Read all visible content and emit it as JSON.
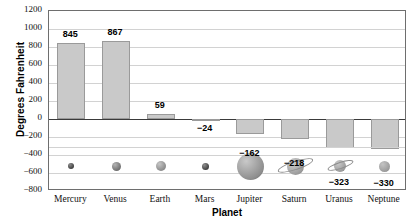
{
  "chart_data": {
    "type": "bar",
    "title": "",
    "xlabel": "Planet",
    "ylabel": "Degrees Fahrenheit",
    "categories": [
      "Mercury",
      "Venus",
      "Earth",
      "Mars",
      "Jupiter",
      "Saturn",
      "Uranus",
      "Neptune"
    ],
    "values": [
      845,
      867,
      59,
      -24,
      -162,
      -218,
      -323,
      -330
    ],
    "value_labels": [
      "845",
      "867",
      "59",
      "−24",
      "−162",
      "−218",
      "−323",
      "−330"
    ],
    "ylim": [
      -800,
      1200
    ],
    "ytick_step": 200,
    "ytick_labels": [
      "1200",
      "1000",
      "800",
      "600",
      "400",
      "200",
      "0",
      "−200",
      "−400",
      "−600",
      "−800"
    ],
    "grid": true,
    "legend": "none",
    "bar_color": "#c9c9c9",
    "bar_border_color": "#9a9a9a",
    "grid_color": "#d2d2d2",
    "frame_color": "#6e6e6e",
    "zero_line_color": "#3a3a3a",
    "planet_icons": [
      {
        "name": "mercury-icon",
        "size": 6,
        "color": "#3f3f3f",
        "highlight": "#8a8a8a",
        "ring": false
      },
      {
        "name": "venus-icon",
        "size": 9,
        "color": "#6e6e6e",
        "highlight": "#b4b4b4",
        "ring": false
      },
      {
        "name": "earth-icon",
        "size": 10,
        "color": "#8a8a8a",
        "highlight": "#c6c6c6",
        "ring": false
      },
      {
        "name": "mars-icon",
        "size": 7,
        "color": "#3f3f3f",
        "highlight": "#909090",
        "ring": false
      },
      {
        "name": "jupiter-icon",
        "size": 27,
        "color": "#8d8d8d",
        "highlight": "#c9c9c9",
        "ring": false
      },
      {
        "name": "saturn-icon",
        "size": 17,
        "color": "#9a9a9a",
        "highlight": "#cfcfcf",
        "ring": true
      },
      {
        "name": "uranus-icon",
        "size": 12,
        "color": "#9a9a9a",
        "highlight": "#cacaca",
        "ring": true
      },
      {
        "name": "neptune-icon",
        "size": 11,
        "color": "#9a9a9a",
        "highlight": "#c4c4c4",
        "ring": false
      }
    ]
  }
}
